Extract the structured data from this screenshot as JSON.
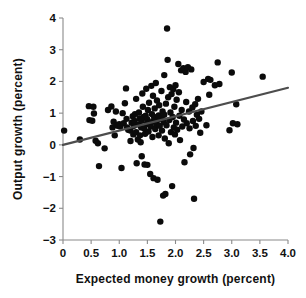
{
  "chart_data": {
    "type": "scatter",
    "title": "",
    "xlabel": "Expected money growth (percent)",
    "ylabel": "Output growth (percent)",
    "xlim": [
      0,
      4
    ],
    "ylim": [
      -3,
      4
    ],
    "xticks": [
      0,
      0.5,
      1.0,
      1.5,
      2.0,
      2.5,
      3.0,
      3.5,
      4.0
    ],
    "xtick_labels": [
      "0",
      "0.5",
      "1.0",
      "1.5",
      "2.0",
      "2.5",
      "3.0",
      "3.5",
      "4.0"
    ],
    "yticks": [
      -3,
      -2,
      -1,
      0,
      1,
      2,
      3,
      4
    ],
    "ytick_labels": [
      "−3",
      "−2",
      "−1",
      "0",
      "1",
      "2",
      "3",
      "4"
    ],
    "grid": false,
    "legend": null,
    "marker_color": "#0b0b0b",
    "marker_size": 3.2,
    "axis_color": "#8a8a8a",
    "series": [
      {
        "name": "Countries",
        "points": [
          [
            0.02,
            0.45
          ],
          [
            0.3,
            0.17
          ],
          [
            0.46,
            1.22
          ],
          [
            0.47,
            0.78
          ],
          [
            0.52,
            0.76
          ],
          [
            0.54,
            1.2
          ],
          [
            0.55,
            0.99
          ],
          [
            0.58,
            0.13
          ],
          [
            0.62,
            0.05
          ],
          [
            0.64,
            -0.67
          ],
          [
            0.74,
            -0.11
          ],
          [
            0.8,
            1.1
          ],
          [
            0.86,
            1.21
          ],
          [
            0.88,
            0.55
          ],
          [
            0.9,
            0.73
          ],
          [
            0.92,
            0.3
          ],
          [
            0.94,
            1.05
          ],
          [
            0.96,
            0.62
          ],
          [
            0.98,
            0.6
          ],
          [
            1.0,
            0.65
          ],
          [
            1.02,
            0.58
          ],
          [
            1.04,
            -0.73
          ],
          [
            1.06,
            1.0
          ],
          [
            1.08,
            0.68
          ],
          [
            1.1,
            1.31
          ],
          [
            1.12,
            1.78
          ],
          [
            1.13,
            0.82
          ],
          [
            1.14,
            0.55
          ],
          [
            1.16,
            0.48
          ],
          [
            1.18,
            0.47
          ],
          [
            1.2,
            0.45
          ],
          [
            1.2,
            0.12
          ],
          [
            1.22,
            0.7
          ],
          [
            1.24,
            0.9
          ],
          [
            1.25,
            0.33
          ],
          [
            1.26,
            0.6
          ],
          [
            1.27,
            0.75
          ],
          [
            1.28,
            0.97
          ],
          [
            1.3,
            1.45
          ],
          [
            1.3,
            0.4
          ],
          [
            1.31,
            -0.58
          ],
          [
            1.33,
            0.17
          ],
          [
            1.34,
            0.64
          ],
          [
            1.35,
            1.02
          ],
          [
            1.36,
            0.83
          ],
          [
            1.37,
            0.3
          ],
          [
            1.38,
            0.08
          ],
          [
            1.39,
            0.55
          ],
          [
            1.4,
            0.76
          ],
          [
            1.4,
            -0.36
          ],
          [
            1.41,
            1.62
          ],
          [
            1.42,
            1.2
          ],
          [
            1.43,
            0.88
          ],
          [
            1.44,
            0.52
          ],
          [
            1.45,
            -0.62
          ],
          [
            1.46,
            0.35
          ],
          [
            1.47,
            0.92
          ],
          [
            1.48,
            1.77
          ],
          [
            1.49,
            0.65
          ],
          [
            1.5,
            0.8
          ],
          [
            1.5,
            -0.63
          ],
          [
            1.51,
            1.1
          ],
          [
            1.52,
            0.42
          ],
          [
            1.53,
            1.33
          ],
          [
            1.54,
            0.7
          ],
          [
            1.55,
            -0.92
          ],
          [
            1.56,
            0.58
          ],
          [
            1.57,
            1.86
          ],
          [
            1.58,
            0.97
          ],
          [
            1.59,
            0.25
          ],
          [
            1.6,
            1.55
          ],
          [
            1.6,
            0.74
          ],
          [
            1.61,
            -1.05
          ],
          [
            1.62,
            0.88
          ],
          [
            1.63,
            1.15
          ],
          [
            1.64,
            0.5
          ],
          [
            1.65,
            1.95
          ],
          [
            1.66,
            0.66
          ],
          [
            1.67,
            1.4
          ],
          [
            1.68,
            -1.1
          ],
          [
            1.69,
            0.79
          ],
          [
            1.7,
            0.93
          ],
          [
            1.7,
            0.3
          ],
          [
            1.71,
            1.25
          ],
          [
            1.72,
            0.6
          ],
          [
            1.73,
            -2.42
          ],
          [
            1.74,
            0.85
          ],
          [
            1.75,
            1.7
          ],
          [
            1.76,
            0.45
          ],
          [
            1.77,
            1.05
          ],
          [
            1.78,
            -1.6
          ],
          [
            1.79,
            0.72
          ],
          [
            1.8,
            2.2
          ],
          [
            1.8,
            0.95
          ],
          [
            1.81,
            0.2
          ],
          [
            1.82,
            -1.55
          ],
          [
            1.83,
            1.3
          ],
          [
            1.84,
            0.62
          ],
          [
            1.85,
            3.67
          ],
          [
            1.86,
            2.68
          ],
          [
            1.87,
            1.5
          ],
          [
            1.88,
            0.05
          ],
          [
            1.89,
            0.78
          ],
          [
            1.9,
            1.82
          ],
          [
            1.91,
            1.02
          ],
          [
            1.92,
            0.4
          ],
          [
            1.93,
            1.6
          ],
          [
            1.94,
            -1.3
          ],
          [
            1.95,
            0.88
          ],
          [
            1.96,
            1.75
          ],
          [
            1.97,
            0.55
          ],
          [
            1.98,
            1.2
          ],
          [
            1.99,
            0.33
          ],
          [
            2.0,
            1.88
          ],
          [
            2.01,
            0.7
          ],
          [
            2.02,
            1.42
          ],
          [
            2.03,
            0.48
          ],
          [
            2.05,
            2.55
          ],
          [
            2.06,
            1.66
          ],
          [
            2.07,
            0.92
          ],
          [
            2.08,
            0.15
          ],
          [
            2.1,
            2.35
          ],
          [
            2.11,
            1.1
          ],
          [
            2.12,
            0.58
          ],
          [
            2.14,
            2.42
          ],
          [
            2.15,
            0.8
          ],
          [
            2.16,
            -0.55
          ],
          [
            2.18,
            2.3
          ],
          [
            2.19,
            1.35
          ],
          [
            2.2,
            0.68
          ],
          [
            2.22,
            2.45
          ],
          [
            2.24,
            1.05
          ],
          [
            2.25,
            0.52
          ],
          [
            2.26,
            -0.3
          ],
          [
            2.28,
            2.38
          ],
          [
            2.3,
            1.18
          ],
          [
            2.31,
            0.75
          ],
          [
            2.32,
            -0.1
          ],
          [
            2.33,
            -1.7
          ],
          [
            2.35,
            1.28
          ],
          [
            2.36,
            0.6
          ],
          [
            2.38,
            0.95
          ],
          [
            2.4,
            1.45
          ],
          [
            2.42,
            0.82
          ],
          [
            2.44,
            0.38
          ],
          [
            2.46,
            1.05
          ],
          [
            2.5,
            1.98
          ],
          [
            2.55,
            0.62
          ],
          [
            2.58,
            2.08
          ],
          [
            2.6,
            1.58
          ],
          [
            2.62,
            2.05
          ],
          [
            2.7,
            1.88
          ],
          [
            2.75,
            2.6
          ],
          [
            2.78,
            1.92
          ],
          [
            2.96,
            0.46
          ],
          [
            3.0,
            2.28
          ],
          [
            3.02,
            0.68
          ],
          [
            3.08,
            1.28
          ],
          [
            3.1,
            0.65
          ],
          [
            3.55,
            2.15
          ]
        ]
      }
    ],
    "trend_line": {
      "name": "Fitted regression line",
      "x_start": 0.0,
      "y_start": 0.0,
      "x_end": 4.0,
      "y_end": 1.8,
      "color": "#4d4d4d"
    }
  }
}
